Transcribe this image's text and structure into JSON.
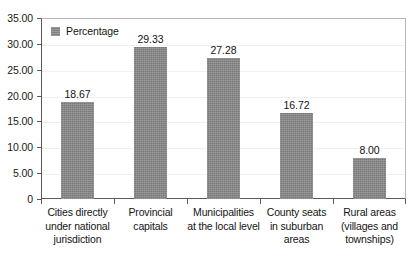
{
  "chart_data": {
    "type": "bar",
    "title": "",
    "subtitle": "",
    "xlabel": "",
    "ylabel": "",
    "ylim": [
      0,
      35
    ],
    "ytick_labels": [
      "0",
      "5.00",
      "10.00",
      "15.00",
      "20.00",
      "25.00",
      "30.00",
      "35.00"
    ],
    "ytick_values": [
      0,
      5,
      10,
      15,
      20,
      25,
      30,
      35
    ],
    "grid": true,
    "legend_position": "top-left-inside",
    "legend": [
      "Percentage"
    ],
    "categories": [
      "Cities directly under national jurisdiction",
      "Provincial capitals",
      "Municipalities at the local level",
      "County seats in suburban areas",
      "Rural areas (villages and townships)"
    ],
    "category_lines": [
      [
        "Cities directly",
        "under national",
        "jurisdiction"
      ],
      [
        "Provincial",
        "capitals"
      ],
      [
        "Municipalities",
        "at the local level"
      ],
      [
        "County seats",
        "in suburban",
        "areas"
      ],
      [
        "Rural areas",
        "(villages and",
        "townships)"
      ]
    ],
    "series": [
      {
        "name": "Percentage",
        "values": [
          18.67,
          29.33,
          27.28,
          16.72,
          8.0
        ],
        "data_labels": [
          "18.67",
          "29.33",
          "27.28",
          "16.72",
          "8.00"
        ],
        "color": "#858585"
      }
    ]
  },
  "colors": {
    "bar": "#858585",
    "legend_swatch": "#8a8a8a",
    "axis": "#5a5a5a",
    "frame": "#b8b8b8",
    "gridline": "#f0f0f0",
    "text": "#141414",
    "background": "#ffffff"
  }
}
